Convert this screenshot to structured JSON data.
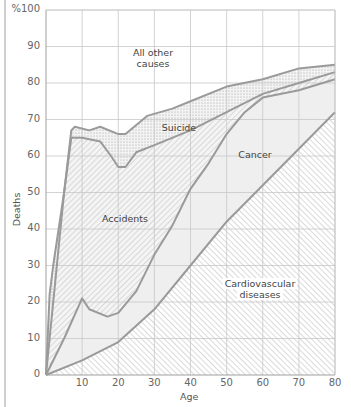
{
  "chart_data": {
    "type": "area",
    "stacked": true,
    "title": "",
    "xlabel": "Age",
    "ylabel": "Deaths",
    "xlim": [
      0,
      80
    ],
    "ylim": [
      0,
      100
    ],
    "grid": true,
    "x_ticks": [
      "10",
      "20",
      "30",
      "40",
      "50",
      "60",
      "70",
      "80"
    ],
    "x_zero_label": "",
    "y_ticks": [
      "0",
      "10",
      "20",
      "30",
      "40",
      "50",
      "60",
      "70",
      "80",
      "90",
      "%100"
    ],
    "boundaries_cumulative_percent": [
      {
        "name": "Cardiovascular diseases (upper edge of region below)",
        "points": [
          [
            0,
            0
          ],
          [
            10,
            4
          ],
          [
            20,
            9
          ],
          [
            30,
            18
          ],
          [
            40,
            30
          ],
          [
            50,
            42
          ],
          [
            60,
            52
          ],
          [
            70,
            62
          ],
          [
            80,
            72
          ]
        ]
      },
      {
        "name": "Cancer (upper edge)",
        "points": [
          [
            0,
            0
          ],
          [
            5,
            10
          ],
          [
            10,
            21
          ],
          [
            12,
            18
          ],
          [
            17,
            16
          ],
          [
            20,
            17
          ],
          [
            25,
            23
          ],
          [
            30,
            33
          ],
          [
            35,
            41
          ],
          [
            40,
            51
          ],
          [
            45,
            58
          ],
          [
            50,
            66
          ],
          [
            55,
            72
          ],
          [
            60,
            76
          ],
          [
            70,
            78
          ],
          [
            80,
            81
          ]
        ]
      },
      {
        "name": "Accidents (upper edge)",
        "points": [
          [
            0,
            0
          ],
          [
            1,
            22
          ],
          [
            2,
            30
          ],
          [
            5,
            50
          ],
          [
            7,
            65
          ],
          [
            10,
            65
          ],
          [
            15,
            64
          ],
          [
            18,
            60
          ],
          [
            20,
            57
          ],
          [
            22,
            57
          ],
          [
            25,
            61
          ],
          [
            30,
            63
          ],
          [
            40,
            67
          ],
          [
            50,
            72
          ],
          [
            60,
            77
          ],
          [
            70,
            80
          ],
          [
            80,
            83
          ]
        ]
      },
      {
        "name": "Suicide (upper edge)",
        "points": [
          [
            0,
            0
          ],
          [
            5,
            50
          ],
          [
            7,
            67
          ],
          [
            8,
            68
          ],
          [
            12,
            67
          ],
          [
            15,
            68
          ],
          [
            20,
            66
          ],
          [
            22,
            66
          ],
          [
            28,
            71
          ],
          [
            35,
            73
          ],
          [
            40,
            75
          ],
          [
            50,
            79
          ],
          [
            60,
            81
          ],
          [
            70,
            84
          ],
          [
            80,
            85
          ]
        ]
      }
    ],
    "regions": [
      {
        "name": "Cardiovascular diseases",
        "fill": "diagonal hatch (\\\\)",
        "between": [
          "x-axis",
          "Cardiovascular diseases (upper edge of region below)"
        ]
      },
      {
        "name": "Cancer",
        "fill": "light gray",
        "between": [
          "Cardiovascular",
          "Cancer"
        ]
      },
      {
        "name": "Accidents",
        "fill": "diagonal hatch (//)",
        "between": [
          "Cancer",
          "Accidents"
        ]
      },
      {
        "name": "Suicide",
        "fill": "stipple dots",
        "between": [
          "Accidents",
          "Suicide"
        ]
      },
      {
        "name": "All other causes",
        "fill": "white",
        "between": [
          "Suicide",
          "100%"
        ]
      }
    ],
    "annotations": [
      {
        "text": "All other causes",
        "x": 23,
        "y": 87
      },
      {
        "text": "Suicide",
        "x": 30,
        "y": 67
      },
      {
        "text": "Cancer",
        "x": 50,
        "y": 59
      },
      {
        "text": "Accidents",
        "x": 20,
        "y": 42
      },
      {
        "text": "Cardiovascular diseases",
        "x": 60,
        "y": 25
      }
    ],
    "legend": "none (inline labels)"
  },
  "labels": {
    "y_axis_title": "Deaths",
    "x_axis_title": "Age",
    "all_other": [
      "All other",
      "causes"
    ],
    "suicide": "Suicide",
    "cancer": "Cancer",
    "accidents": "Accidents",
    "cardio": [
      "Cardiovascular",
      "diseases"
    ]
  },
  "ticks": {
    "y": [
      "0",
      "10",
      "20",
      "30",
      "40",
      "50",
      "60",
      "70",
      "80",
      "90",
      "%100"
    ],
    "x": [
      "10",
      "20",
      "30",
      "40",
      "50",
      "60",
      "70",
      "80"
    ]
  },
  "colors": {
    "line": "#9a9a9a",
    "grid": "#cccccc",
    "cancer_fill": "#efefef",
    "hatch": "#b5b5b5",
    "dots": "#9e9e9e"
  }
}
